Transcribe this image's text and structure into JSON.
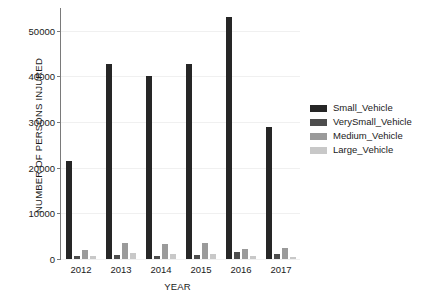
{
  "chart_data": {
    "type": "bar",
    "title": "",
    "xlabel": "YEAR",
    "ylabel": "NUMBER OF PERSONS INJURED",
    "categories": [
      "2012",
      "2013",
      "2014",
      "2015",
      "2016",
      "2017"
    ],
    "ylim": [
      0,
      55000
    ],
    "yticks": [
      0,
      10000,
      20000,
      30000,
      40000,
      50000
    ],
    "ytick_labels": [
      "0",
      "10000",
      "20000",
      "30000",
      "40000",
      "50000"
    ],
    "grid": true,
    "legend_position": "right",
    "series": [
      {
        "name": "Small_Vehicle",
        "color": "#262626",
        "values": [
          21500,
          42800,
          40200,
          42800,
          53000,
          29000
        ]
      },
      {
        "name": "VerySmall_Vehicle",
        "color": "#4d4d4d",
        "values": [
          700,
          800,
          750,
          800,
          1600,
          1100
        ]
      },
      {
        "name": "Medium_Vehicle",
        "color": "#9a9a9a",
        "values": [
          2000,
          3600,
          3300,
          3400,
          2300,
          2400
        ]
      },
      {
        "name": "Large_Vehicle",
        "color": "#c8c8c8",
        "values": [
          600,
          1300,
          1200,
          1200,
          700,
          500
        ]
      }
    ]
  },
  "legend": {
    "items": [
      {
        "label": "Small_Vehicle",
        "color": "#262626"
      },
      {
        "label": "VerySmall_Vehicle",
        "color": "#4d4d4d"
      },
      {
        "label": "Medium_Vehicle",
        "color": "#9a9a9a"
      },
      {
        "label": "Large_Vehicle",
        "color": "#c8c8c8"
      }
    ]
  }
}
